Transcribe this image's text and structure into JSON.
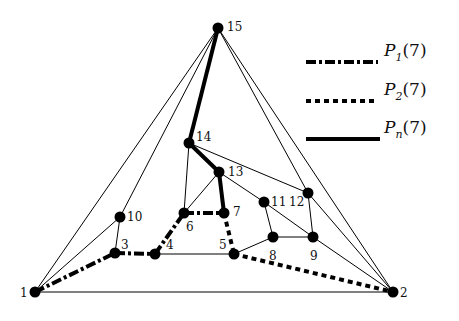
{
  "diagram": {
    "type": "graph",
    "nodes": [
      {
        "id": "1",
        "x": 35,
        "y": 292,
        "lx": 20,
        "ly": 297
      },
      {
        "id": "2",
        "x": 393,
        "y": 292,
        "lx": 400,
        "ly": 297
      },
      {
        "id": "3",
        "x": 115,
        "y": 253,
        "lx": 121,
        "ly": 249
      },
      {
        "id": "4",
        "x": 155,
        "y": 254,
        "lx": 166,
        "ly": 249
      },
      {
        "id": "5",
        "x": 234,
        "y": 254,
        "lx": 219,
        "ly": 249
      },
      {
        "id": "6",
        "x": 184,
        "y": 213,
        "lx": 186,
        "ly": 231
      },
      {
        "id": "7",
        "x": 224,
        "y": 213,
        "lx": 233,
        "ly": 216
      },
      {
        "id": "8",
        "x": 273,
        "y": 237,
        "lx": 269,
        "ly": 260
      },
      {
        "id": "9",
        "x": 313,
        "y": 237,
        "lx": 310,
        "ly": 260
      },
      {
        "id": "10",
        "x": 120,
        "y": 217,
        "lx": 127,
        "ly": 221
      },
      {
        "id": "11",
        "x": 264,
        "y": 202,
        "lx": 271,
        "ly": 206
      },
      {
        "id": "12",
        "x": 308,
        "y": 193,
        "lx": 289,
        "ly": 206
      },
      {
        "id": "13",
        "x": 219,
        "y": 172,
        "lx": 228,
        "ly": 176
      },
      {
        "id": "14",
        "x": 189,
        "y": 143,
        "lx": 196,
        "ly": 141
      },
      {
        "id": "15",
        "x": 218,
        "y": 28,
        "lx": 227,
        "ly": 31
      }
    ],
    "edges": [
      {
        "from": "15",
        "to": "1",
        "style": "thin"
      },
      {
        "from": "15",
        "to": "10",
        "style": "thin"
      },
      {
        "from": "15",
        "to": "12",
        "style": "thin"
      },
      {
        "from": "15",
        "to": "2",
        "style": "thin"
      },
      {
        "from": "1",
        "to": "2",
        "style": "thin"
      },
      {
        "from": "1",
        "to": "10",
        "style": "thin"
      },
      {
        "from": "10",
        "to": "3",
        "style": "thin"
      },
      {
        "from": "4",
        "to": "5",
        "style": "thin"
      },
      {
        "from": "6",
        "to": "14",
        "style": "thin"
      },
      {
        "from": "6",
        "to": "13",
        "style": "thin"
      },
      {
        "from": "14",
        "to": "12",
        "style": "thin"
      },
      {
        "from": "13",
        "to": "11",
        "style": "thin"
      },
      {
        "from": "11",
        "to": "9",
        "style": "thin"
      },
      {
        "from": "11",
        "to": "8",
        "style": "thin"
      },
      {
        "from": "5",
        "to": "8",
        "style": "thin"
      },
      {
        "from": "8",
        "to": "9",
        "style": "thin"
      },
      {
        "from": "12",
        "to": "9",
        "style": "thin"
      },
      {
        "from": "9",
        "to": "2",
        "style": "thin"
      },
      {
        "from": "12",
        "to": "2",
        "style": "thin"
      },
      {
        "from": "1",
        "to": "3",
        "style": "p1"
      },
      {
        "from": "3",
        "to": "4",
        "style": "p1"
      },
      {
        "from": "4",
        "to": "6",
        "style": "p1"
      },
      {
        "from": "6",
        "to": "7",
        "style": "p1"
      },
      {
        "from": "7",
        "to": "5",
        "style": "p2"
      },
      {
        "from": "5",
        "to": "2",
        "style": "p2"
      },
      {
        "from": "15",
        "to": "14",
        "style": "pn"
      },
      {
        "from": "14",
        "to": "13",
        "style": "pn"
      },
      {
        "from": "13",
        "to": "7",
        "style": "pn"
      }
    ],
    "legend": [
      {
        "style": "p1",
        "label_main": "P",
        "label_sub": "1",
        "label_arg": "(7)"
      },
      {
        "style": "p2",
        "label_main": "P",
        "label_sub": "2",
        "label_arg": "(7)"
      },
      {
        "style": "pn",
        "label_main": "P",
        "label_sub": "n",
        "label_arg": "(7)"
      }
    ]
  }
}
